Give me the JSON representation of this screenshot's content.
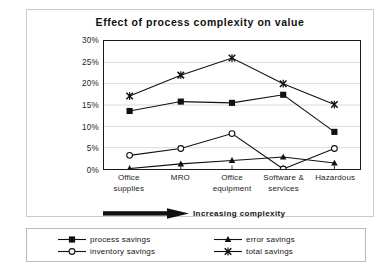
{
  "chart_data": {
    "type": "line",
    "title": "Effect of process complexity on value",
    "xlabel": "",
    "ylabel": "Cost savings as % of total savings",
    "categories": [
      "Office supplies",
      "MRO",
      "Office equipment",
      "Software & services",
      "Hazardous"
    ],
    "category_lines": [
      [
        "Office",
        "supplies"
      ],
      [
        "MRO",
        ""
      ],
      [
        "Office",
        "equipment"
      ],
      [
        "Software &",
        "services"
      ],
      [
        "Hazardous",
        ""
      ]
    ],
    "ylim": [
      0,
      30
    ],
    "ytick_values": [
      30,
      25,
      20,
      15,
      10,
      5,
      0
    ],
    "ytick_labels": [
      "30%",
      "25%",
      "20%",
      "15%",
      "10%",
      "5%",
      "0%"
    ],
    "grid": true,
    "legend_position": "bottom",
    "series": [
      {
        "name": "process savings",
        "marker": "filled-square",
        "color": "#111111",
        "values": [
          13.6,
          15.8,
          15.5,
          17.4,
          8.7
        ]
      },
      {
        "name": "inventory savings",
        "marker": "open-circle",
        "color": "#111111",
        "values": [
          3.2,
          4.8,
          8.3,
          0.0,
          4.8
        ]
      },
      {
        "name": "error savings",
        "marker": "filled-triangle",
        "color": "#111111",
        "values": [
          0.1,
          1.2,
          2.0,
          2.8,
          1.4
        ]
      },
      {
        "name": "total savings",
        "marker": "cross-x",
        "color": "#111111",
        "values": [
          17.1,
          22.0,
          26.0,
          20.0,
          15.1
        ]
      }
    ],
    "annotation": {
      "text": "Increasing complexity",
      "arrow": "right-arrow"
    }
  },
  "legend": {
    "entries": [
      {
        "label": "process savings",
        "marker": "filled-square"
      },
      {
        "label": "error savings",
        "marker": "filled-triangle"
      },
      {
        "label": "inventory savings",
        "marker": "open-circle"
      },
      {
        "label": "total savings",
        "marker": "cross-x"
      }
    ]
  }
}
